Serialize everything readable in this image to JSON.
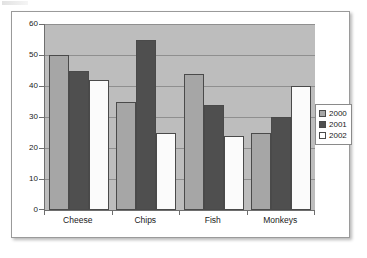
{
  "chart_data": {
    "type": "bar",
    "title": "",
    "xlabel": "",
    "ylabel": "",
    "categories": [
      "Cheese",
      "Chips",
      "Fish",
      "Monkeys"
    ],
    "series": [
      {
        "name": "2000",
        "color": "#a6a6a6",
        "values": [
          50,
          35,
          44,
          25
        ]
      },
      {
        "name": "2001",
        "color": "#4f4f4f",
        "values": [
          45,
          55,
          34,
          30
        ]
      },
      {
        "name": "2002",
        "color": "#ffffff",
        "values": [
          42,
          25,
          24,
          40
        ]
      }
    ],
    "ylim": [
      0,
      60
    ],
    "ytick_step": 10,
    "yticks": [
      0,
      10,
      20,
      30,
      40,
      50,
      60
    ],
    "ytick_labels": [
      "0",
      "10",
      "20",
      "30",
      "40",
      "50",
      "60"
    ],
    "grid": true,
    "grid_axis": "y",
    "legend": true,
    "legend_position": "right",
    "plot_background": "#bdbdbd",
    "figure_background": "#ffffff",
    "axis_color": "#6e6e6e",
    "gridline_color": "#8f8f8f"
  }
}
